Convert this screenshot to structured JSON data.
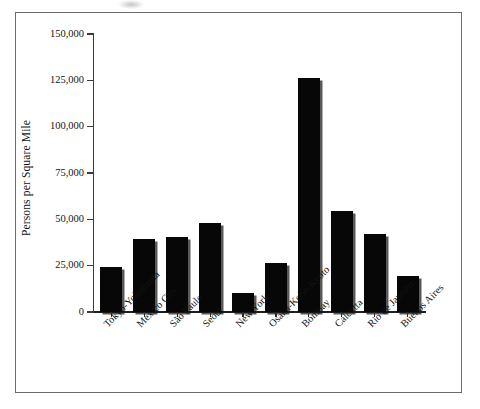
{
  "figure": {
    "border_color": "#6b6b6b",
    "bar_color": "#070707"
  },
  "chart_data": {
    "type": "bar",
    "title": "",
    "xlabel": "",
    "ylabel": "Persons per Square Mile",
    "categories": [
      "Tokyo-Yokohama",
      "Mexico City",
      "São Paulo",
      "Seoul",
      "New York",
      "Osaka-Kobe-Kyoto",
      "Bombay",
      "Calcutta",
      "Rio de Janeiro",
      "Buenos Aires"
    ],
    "values": [
      24500,
      39500,
      40500,
      48000,
      10500,
      26500,
      126000,
      54500,
      42000,
      19500
    ],
    "ylim": [
      0,
      150000
    ],
    "yticks": [
      0,
      25000,
      50000,
      75000,
      100000,
      125000,
      150000
    ],
    "ytick_labels": [
      "0",
      "25,000",
      "50,000",
      "75,000",
      "100,000",
      "125,000",
      "150,000"
    ],
    "grid": false,
    "legend": null
  }
}
